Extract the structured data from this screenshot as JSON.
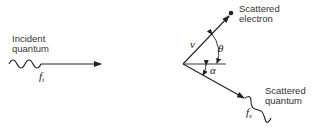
{
  "diagram": {
    "incident": {
      "label_line1": "Incident",
      "label_line2": "quantum",
      "symbol": "f",
      "subscript": "i"
    },
    "electron": {
      "label_line1": "Scattered",
      "label_line2": "electron",
      "velocity_symbol": "v",
      "angle_symbol": "θ"
    },
    "scattered_quantum": {
      "label_line1": "Scattered",
      "label_line2": "quantum",
      "symbol": "f",
      "subscript": "s",
      "angle_symbol": "α"
    },
    "colors": {
      "stroke": "#222222",
      "text": "#333333"
    }
  }
}
